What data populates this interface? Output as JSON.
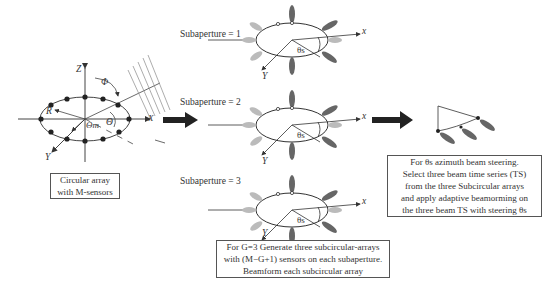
{
  "left_array": {
    "axes": {
      "z": "Z",
      "x": "X",
      "y": "Y"
    },
    "symbols": {
      "phi": "Φ",
      "radius": "R",
      "theta": "Θ",
      "theta_m": "Θm"
    },
    "caption": [
      "Circular array",
      "with M-sensors"
    ]
  },
  "subapertures": [
    {
      "label": "Subaperture = 1",
      "x_axis": "x",
      "y_axis": "Y",
      "angle": "θs"
    },
    {
      "label": "Subaperture = 2",
      "x_axis": "x",
      "y_axis": "Y",
      "angle": "θs"
    },
    {
      "label": "Subaperture = 3",
      "x_axis": "x",
      "y_axis": "Y",
      "angle": "θs"
    }
  ],
  "middle_caption": [
    "For G=3  Generate three subcircular-arrays",
    "with (M−G+1)  sensors on each subaperture.",
    "Beamform each subcircular array"
  ],
  "right_caption": [
    "For θs azimuth beam steering.",
    "Select three beam time series (TS)",
    "from the three Subcircular arrays",
    "and apply adaptive beamorming on",
    "the three beam TS with steering  θs"
  ],
  "colors": {
    "line": "#333333",
    "sensor": "#222222",
    "beam_dark": "#555555",
    "beam_light": "#aaaaaa",
    "arrow": "#222222"
  }
}
